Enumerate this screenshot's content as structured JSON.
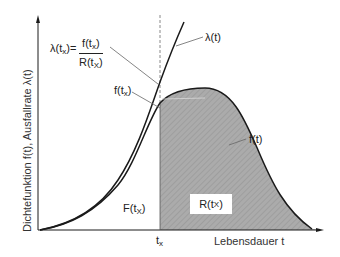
{
  "diagram": {
    "y_axis_label": "Dichtefunktion f(t), Ausfallrate λ(t)",
    "x_axis_label": "Lebensdauer t",
    "tx_tick_label": "t",
    "tx_tick_sub": "x",
    "curves": {
      "lambda_label": "λ(t)",
      "density_label": "f(t)"
    },
    "annotations": {
      "lambda_tx_lhs": "λ(t",
      "lambda_tx_lhs_sub": "x",
      "lambda_tx_lhs_end": ")=",
      "frac_num": "f(t",
      "frac_num_sub": "x",
      "frac_num_end": ")",
      "frac_den": "R(t",
      "frac_den_sub": "X",
      "frac_den_end": ")",
      "f_tx": "f(t",
      "f_tx_sub": "x",
      "f_tx_end": ")"
    },
    "regions": {
      "left_area_label": "F(t",
      "left_area_sub": "X",
      "left_area_end": ")",
      "right_area_label": "R(t",
      "right_area_sub": "X",
      "right_area_end": ")"
    },
    "colors": {
      "line": "#1a1a1a",
      "shade": "#a9a9a9",
      "hatch": "#8c8c8c",
      "dashed": "#888888"
    }
  }
}
